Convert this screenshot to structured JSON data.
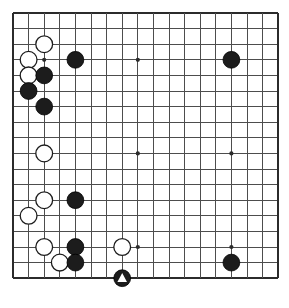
{
  "diagram": {
    "caption": "",
    "board": {
      "type": "go-board",
      "columns": 18,
      "rows": 18,
      "visible_grid_lines_x": 18,
      "visible_grid_lines_y": 18,
      "origin_x": 13,
      "origin_y": 13,
      "spacing": 15.6,
      "line_color": "#4d4d4d",
      "border_color": "#2b2b2b",
      "background_color": "#ffffff",
      "border_width": 2.4,
      "line_width": 1.0,
      "stone_radius": 8.4,
      "star_point_radius": 2.1,
      "star_color": "#2b2b2b"
    },
    "colors": {
      "black_stone_fill": "#1c1c1c",
      "black_stone_edge": "#000000",
      "white_stone_fill": "#ffffff",
      "white_stone_edge": "#1c1c1c",
      "marker_triangle": "#ffffff"
    },
    "star_points": [
      {
        "col": 2,
        "row": 3
      },
      {
        "col": 8,
        "row": 3
      },
      {
        "col": 14,
        "row": 3
      },
      {
        "col": 2,
        "row": 9
      },
      {
        "col": 8,
        "row": 9
      },
      {
        "col": 14,
        "row": 9
      },
      {
        "col": 2,
        "row": 15
      },
      {
        "col": 8,
        "row": 15
      },
      {
        "col": 14,
        "row": 15
      }
    ],
    "stones": [
      {
        "id": "w1",
        "color": "white",
        "col": 2,
        "row": 2,
        "marker": "none"
      },
      {
        "id": "w2",
        "color": "white",
        "col": 1,
        "row": 3,
        "marker": "none"
      },
      {
        "id": "b1",
        "color": "black",
        "col": 4,
        "row": 3,
        "marker": "none"
      },
      {
        "id": "b2",
        "color": "black",
        "col": 14,
        "row": 3,
        "marker": "none"
      },
      {
        "id": "w3",
        "color": "white",
        "col": 1,
        "row": 4,
        "marker": "none"
      },
      {
        "id": "b3",
        "color": "black",
        "col": 2,
        "row": 4,
        "marker": "none"
      },
      {
        "id": "b4",
        "color": "black",
        "col": 1,
        "row": 5,
        "marker": "none"
      },
      {
        "id": "b5",
        "color": "black",
        "col": 2,
        "row": 6,
        "marker": "none"
      },
      {
        "id": "w4",
        "color": "white",
        "col": 2,
        "row": 9,
        "marker": "none"
      },
      {
        "id": "w5",
        "color": "white",
        "col": 2,
        "row": 12,
        "marker": "none"
      },
      {
        "id": "b6",
        "color": "black",
        "col": 4,
        "row": 12,
        "marker": "none"
      },
      {
        "id": "w6",
        "color": "white",
        "col": 1,
        "row": 13,
        "marker": "none"
      },
      {
        "id": "w7",
        "color": "white",
        "col": 2,
        "row": 15,
        "marker": "none"
      },
      {
        "id": "b7",
        "color": "black",
        "col": 4,
        "row": 15,
        "marker": "none"
      },
      {
        "id": "w8",
        "color": "white",
        "col": 7,
        "row": 15,
        "marker": "none"
      },
      {
        "id": "w9",
        "color": "white",
        "col": 3,
        "row": 16,
        "marker": "none"
      },
      {
        "id": "b8",
        "color": "black",
        "col": 4,
        "row": 16,
        "marker": "none"
      },
      {
        "id": "b9",
        "color": "black",
        "col": 14,
        "row": 16,
        "marker": "none"
      },
      {
        "id": "b10",
        "color": "black",
        "col": 7,
        "row": 17,
        "marker": "triangle"
      }
    ],
    "counts": {
      "black_stones": "10",
      "white_stones": "9",
      "marked_stones": "1"
    }
  }
}
